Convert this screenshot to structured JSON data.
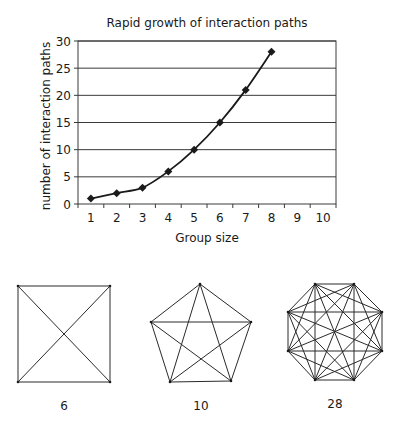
{
  "chart_data": {
    "type": "line",
    "title": "Rapid growth of interaction paths",
    "xlabel": "Group size",
    "ylabel": "number of interaction paths",
    "x": [
      1,
      2,
      3,
      4,
      5,
      6,
      7,
      8
    ],
    "series": [
      {
        "name": "interaction paths",
        "values": [
          1,
          2,
          3,
          6,
          10,
          15,
          21,
          28
        ],
        "marker": "diamond"
      }
    ],
    "x_ticks": [
      "1",
      "2",
      "3",
      "4",
      "5",
      "6",
      "7",
      "8",
      "9",
      "10"
    ],
    "y_ticks": [
      "0",
      "5",
      "10",
      "15",
      "20",
      "25",
      "30"
    ],
    "ylim": [
      0,
      30
    ],
    "xlim": [
      0.5,
      10.5
    ],
    "grid": "horizontal",
    "legend": "none"
  },
  "diagrams": [
    {
      "shape": "square",
      "vertices": 4,
      "label": "6"
    },
    {
      "shape": "pentagon",
      "vertices": 5,
      "label": "10"
    },
    {
      "shape": "octagon",
      "vertices": 8,
      "label": "28"
    }
  ],
  "colors": {
    "line": "#1a1a1a",
    "grid": "#3a3a3a",
    "background": "#ffffff"
  }
}
